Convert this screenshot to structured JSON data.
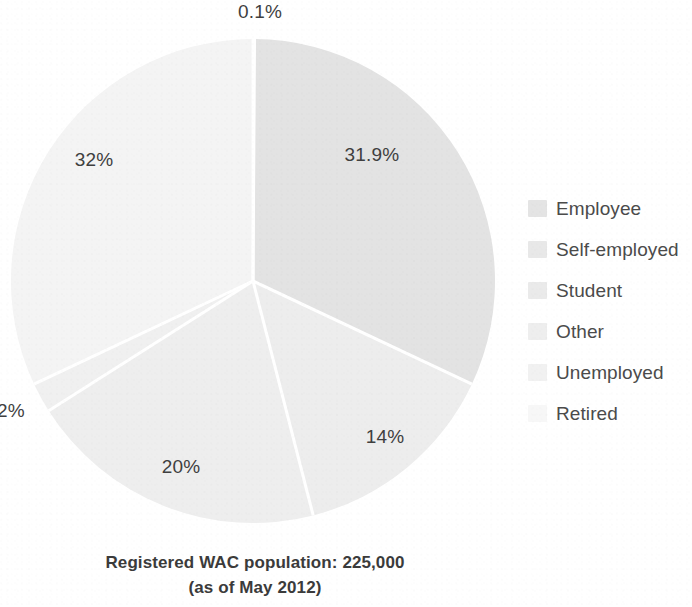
{
  "chart_data": {
    "type": "pie",
    "title": "",
    "caption_line1": "Registered WAC population: 225,000",
    "caption_line2": "(as of May 2012)",
    "total_label": "225,000",
    "legend_position": "right",
    "start_angle_deg": 0,
    "direction": "clockwise",
    "center": {
      "x": 253,
      "y": 281
    },
    "radius": 242,
    "categories": [
      "Unemployed",
      "Employee",
      "Self-employed",
      "Student",
      "Other",
      "Retired"
    ],
    "values": [
      0.1,
      31.9,
      14,
      20,
      2,
      32
    ],
    "value_labels": [
      "0.1%",
      "31.9%",
      "14%",
      "20%",
      "2%",
      "32%"
    ],
    "slices": [
      {
        "name": "Unemployed",
        "value": 0.1,
        "label": "0.1%",
        "color": "#ededed",
        "start_deg": 0.0,
        "end_deg": 0.36,
        "label_x": 260,
        "label_y": 12,
        "label_anchor": "middle"
      },
      {
        "name": "Employee",
        "value": 31.9,
        "label": "31.9%",
        "color": "#e3e3e3",
        "start_deg": 0.36,
        "end_deg": 115.2,
        "label_x": 372,
        "label_y": 155,
        "label_anchor": "middle"
      },
      {
        "name": "Self-employed",
        "value": 14.0,
        "label": "14%",
        "color": "#ededed",
        "start_deg": 115.2,
        "end_deg": 165.6,
        "label_x": 385,
        "label_y": 437,
        "label_anchor": "middle"
      },
      {
        "name": "Student",
        "value": 20.0,
        "label": "20%",
        "color": "#eeeeee",
        "start_deg": 165.6,
        "end_deg": 237.6,
        "label_x": 181,
        "label_y": 467,
        "label_anchor": "middle"
      },
      {
        "name": "Other",
        "value": 2.0,
        "label": "2%",
        "color": "#f0f0f0",
        "start_deg": 237.6,
        "end_deg": 244.8,
        "label_x": 11,
        "label_y": 411,
        "label_anchor": "middle"
      },
      {
        "name": "Retired",
        "value": 32.0,
        "label": "32%",
        "color": "#f4f4f4",
        "start_deg": 244.8,
        "end_deg": 360.0,
        "label_x": 94,
        "label_y": 160,
        "label_anchor": "middle"
      }
    ],
    "separator_color": "#ffffff",
    "separator_width": 3
  },
  "legend": {
    "items": [
      {
        "label": "Employee",
        "swatch_color": "#e4e4e4"
      },
      {
        "label": "Self-employed",
        "swatch_color": "#e8e8e8"
      },
      {
        "label": "Student",
        "swatch_color": "#eaeaea"
      },
      {
        "label": "Other",
        "swatch_color": "#eeeeee"
      },
      {
        "label": "Unemployed",
        "swatch_color": "#f1f1f1"
      },
      {
        "label": "Retired",
        "swatch_color": "#f7f7f7"
      }
    ]
  },
  "caption": {
    "line1": "Registered WAC population: 225,000",
    "line2": "(as of May 2012)"
  }
}
